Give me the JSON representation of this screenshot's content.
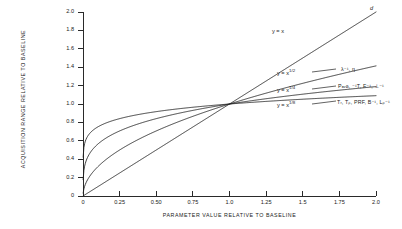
{
  "chart_data": {
    "type": "line",
    "title": "",
    "xlabel": "PARAMETER VALUE RELATIVE TO BASELINE",
    "ylabel": "ACQUISITION RANGE RELATIVE TO BASELINE",
    "xlim": [
      0,
      2.0
    ],
    "ylim": [
      0,
      2.0
    ],
    "grid": false,
    "legend_position": "inline-right",
    "xticks": [
      "0",
      "0.25",
      "0.50",
      "0.75",
      "1.0",
      "1.25",
      "1.5",
      "1.75",
      "2.0"
    ],
    "xtick_values": [
      0,
      0.25,
      0.5,
      0.75,
      1.0,
      1.25,
      1.5,
      1.75,
      2.0
    ],
    "yticks": [
      "0",
      "0.2",
      "0.4",
      "0.6",
      "0.8",
      "1.0",
      "1.2",
      "1.4",
      "1.6",
      "1.8",
      "2.0"
    ],
    "ytick_values": [
      0,
      0.2,
      0.4,
      0.6,
      0.8,
      1.0,
      1.2,
      1.4,
      1.6,
      1.8,
      2.0
    ],
    "x": [
      0,
      0.125,
      0.25,
      0.375,
      0.5,
      0.625,
      0.75,
      0.875,
      1.0,
      1.25,
      1.5,
      1.75,
      2.0
    ],
    "series": [
      {
        "name": "y = x",
        "exponent": 1,
        "values": [
          0,
          0.125,
          0.25,
          0.375,
          0.5,
          0.625,
          0.75,
          0.875,
          1.0,
          1.25,
          1.5,
          1.75,
          2.0
        ]
      },
      {
        "name": "y = x 1/2",
        "exponent": 0.5,
        "values": [
          0,
          0.354,
          0.5,
          0.612,
          0.707,
          0.791,
          0.866,
          0.935,
          1.0,
          1.118,
          1.225,
          1.323,
          1.414
        ]
      },
      {
        "name": "y = x 1/4",
        "exponent": 0.25,
        "values": [
          0,
          0.595,
          0.707,
          0.783,
          0.841,
          0.889,
          0.931,
          0.967,
          1.0,
          1.057,
          1.107,
          1.15,
          1.189
        ]
      },
      {
        "name": "y = x 1/8",
        "exponent": 0.125,
        "values": [
          0,
          0.771,
          0.841,
          0.885,
          0.917,
          0.943,
          0.965,
          0.984,
          1.0,
          1.028,
          1.052,
          1.072,
          1.091
        ]
      }
    ],
    "annotations": [
      {
        "text": "d",
        "for": "y = x"
      },
      {
        "text": "λ⁻¹, η",
        "for": "y = x 1/2"
      },
      {
        "text": "Pₐᵥɢ, ⁻¹T, F⁻¹, ⊥⁻¹",
        "for": "y = x 1/4"
      },
      {
        "text": "Tᵣ, Tₚ, PRF, B⁻¹, Lₚ⁻¹",
        "for": "y = x 1/8"
      }
    ]
  },
  "curve_labels": {
    "c1_base": "y = x",
    "c1_exp": "",
    "c2_base": "y = x",
    "c2_exp": "1/2",
    "c3_base": "y = x",
    "c3_exp": "1/4",
    "c4_base": "y = x",
    "c4_exp": "1/8"
  },
  "param_labels": {
    "diagonal": "d",
    "p1": "λ⁻¹, η",
    "p2": "Pₐᵥɢ, ⁻¹T, F⁻¹, ⊥⁻¹",
    "p3": "Tᵣ, Tₚ, PRF, B⁻¹, Lₚ⁻¹"
  },
  "colors": {
    "axis": "#2a2a2a",
    "curve": "#202020",
    "text": "#1a1a1a",
    "background": "#ffffff"
  }
}
